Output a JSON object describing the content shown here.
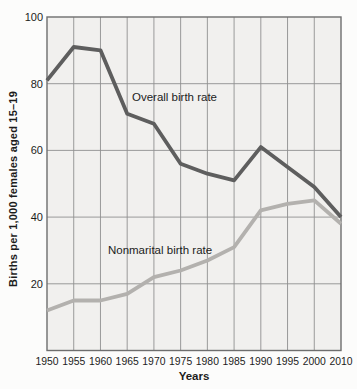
{
  "chart_data": {
    "type": "line",
    "title": "",
    "xlabel": "Years",
    "ylabel": "Births per 1,000 females aged 15–19",
    "categories": [
      "1950",
      "1955",
      "1960",
      "1965",
      "1970",
      "1975",
      "1980",
      "1985",
      "1990",
      "1995",
      "2000",
      "2010"
    ],
    "ylim": [
      0,
      100
    ],
    "yticks": [
      20,
      40,
      60,
      80,
      100
    ],
    "grid": true,
    "legend_position": "inline-labels",
    "series": [
      {
        "name": "Overall birth rate",
        "color": "#5e5e5e",
        "line_width": 3.8,
        "values": [
          81,
          91,
          90,
          71,
          68,
          56,
          53,
          51,
          61,
          55,
          49,
          40
        ]
      },
      {
        "name": "Nonmarital birth rate",
        "color": "#b3b1ae",
        "line_width": 3.8,
        "values": [
          12,
          15,
          15,
          17,
          22,
          24,
          27,
          31,
          42,
          44,
          45,
          38
        ]
      }
    ],
    "annotations": [
      {
        "text": "Overall birth rate",
        "xi": 3.18,
        "y": 76,
        "anchor": "start"
      },
      {
        "text": "Nonmarital birth rate",
        "xi": 2.28,
        "y": 30,
        "anchor": "start"
      }
    ]
  },
  "colors": {
    "page_bg": "#fcfcfb",
    "plot_bg": "#f1f0ee",
    "grid": "#909090",
    "border": "#6e6e6e",
    "text": "#1c1c1c"
  }
}
